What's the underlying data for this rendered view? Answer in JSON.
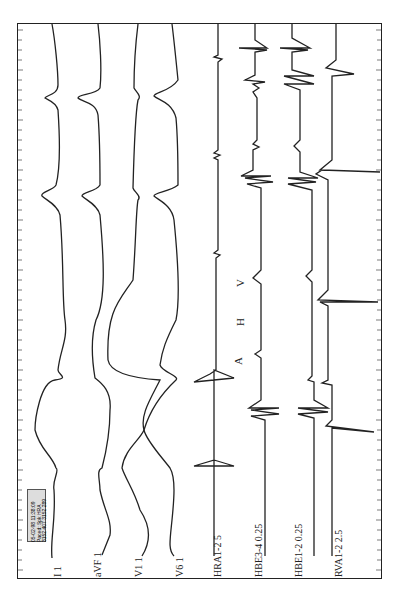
{
  "figure": {
    "info_box": {
      "line1": "05-02-98 11:38:09",
      "line2": "Paced: Spk HRA",
      "line3": "3152  407  3152  289"
    },
    "channels": [
      {
        "name": "I",
        "gain": "1",
        "label": "I  1"
      },
      {
        "name": "aVF",
        "gain": "1",
        "label": "aVF  1"
      },
      {
        "name": "V1",
        "gain": "1",
        "label": "V1  1"
      },
      {
        "name": "V6",
        "gain": "1",
        "label": "V6  1"
      },
      {
        "name": "HRA1-2",
        "gain": "5",
        "label": "HRA1-2  5"
      },
      {
        "name": "HBE3-4",
        "gain": "0.25",
        "label": "HBE3-4  0.25"
      },
      {
        "name": "HBE1-2",
        "gain": "0.25",
        "label": "HBE1-2  0.25"
      },
      {
        "name": "RVA1-2",
        "gain": "2.5",
        "label": "RVA1-2  2.5"
      }
    ],
    "annotations": {
      "a": "A",
      "h": "H",
      "v": "V"
    },
    "colors": {
      "trace": "#222222",
      "background": "#ffffff",
      "info_box": "#dddddd"
    }
  }
}
